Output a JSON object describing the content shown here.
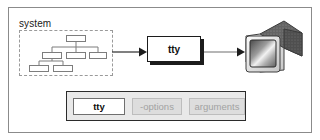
{
  "figure": {
    "type": "diagram"
  },
  "flow": {
    "system_group": {
      "label": "system",
      "border_style": "dashed",
      "contents_icon": "hierarchy-tree-icon",
      "tree": {
        "root": {
          "x": 47,
          "y": 5,
          "w": 20,
          "h": 7
        },
        "children": [
          {
            "x": 23,
            "y": 22,
            "w": 20,
            "h": 7
          },
          {
            "x": 47,
            "y": 22,
            "w": 20,
            "h": 7
          },
          {
            "x": 70,
            "y": 22,
            "w": 20,
            "h": 7
          }
        ],
        "grandchildren": [
          {
            "x": 10,
            "y": 35,
            "w": 20,
            "h": 7
          },
          {
            "x": 34,
            "y": 35,
            "w": 20,
            "h": 7
          }
        ]
      }
    },
    "arrow_1": {
      "icon": "arrow-right-icon",
      "from": "system",
      "to": "tty-process"
    },
    "process_box": {
      "label": "tty",
      "has_drop_shadow": true
    },
    "arrow_2": {
      "icon": "arrow-right-icon",
      "from": "tty-process",
      "to": "terminal-monitor"
    },
    "output_device": {
      "icon": "crt-monitor-icon",
      "label": ""
    }
  },
  "syntax": {
    "tokens": [
      {
        "text": "tty",
        "kind": "command"
      },
      {
        "text": "-options",
        "kind": "optional"
      },
      {
        "text": "arguments",
        "kind": "optional"
      }
    ]
  },
  "colors": {
    "frame_border": "#8b8b8b",
    "box_outline": "#1c1c1c",
    "shadow": "#1c1c1c",
    "dashed_border": "#9a9a9a",
    "syntax_bar_bg": "#e9e9e9",
    "syntax_bar_border": "#2b2b2b",
    "optional_token_bg": "#dddddd",
    "optional_token_text": "#a2a2a2",
    "command_token_bg": "#ffffff",
    "command_token_text": "#0d0d0d",
    "text": "#1a1a1a"
  }
}
